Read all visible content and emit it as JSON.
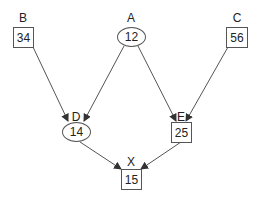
{
  "diagram": {
    "nodes": {
      "B": {
        "label": "B",
        "value": "34",
        "shape": "square"
      },
      "A": {
        "label": "A",
        "value": "12",
        "shape": "ellipse"
      },
      "C": {
        "label": "C",
        "value": "56",
        "shape": "square"
      },
      "D": {
        "label": "D",
        "value": "14",
        "shape": "ellipse"
      },
      "E": {
        "label": "E",
        "value": "25",
        "shape": "square"
      },
      "X": {
        "label": "X",
        "value": "15",
        "shape": "square"
      }
    },
    "edges": [
      {
        "from": "B",
        "to": "D"
      },
      {
        "from": "A",
        "to": "D"
      },
      {
        "from": "A",
        "to": "E"
      },
      {
        "from": "C",
        "to": "E"
      },
      {
        "from": "D",
        "to": "X"
      },
      {
        "from": "E",
        "to": "X"
      }
    ],
    "colors": {
      "stroke": "#555555",
      "text": "#222222",
      "background": "#ffffff"
    }
  }
}
